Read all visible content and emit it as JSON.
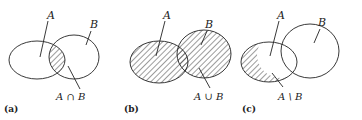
{
  "figure": {
    "panels": [
      {
        "id": "a",
        "panel_label": "(a)",
        "set_a_label": "A",
        "set_b_label": "B",
        "operation_label": "A ∩ B",
        "shaded_region": "intersection"
      },
      {
        "id": "b",
        "panel_label": "(b)",
        "set_a_label": "A",
        "set_b_label": "B",
        "operation_label": "A ∪ B",
        "shaded_region": "union"
      },
      {
        "id": "c",
        "panel_label": "(c)",
        "set_a_label": "A",
        "set_b_label": "B",
        "operation_label": "A \\ B",
        "shaded_region": "difference"
      }
    ],
    "colors": {
      "stroke": "#222222",
      "hatch": "#222222",
      "background": "#ffffff"
    }
  }
}
